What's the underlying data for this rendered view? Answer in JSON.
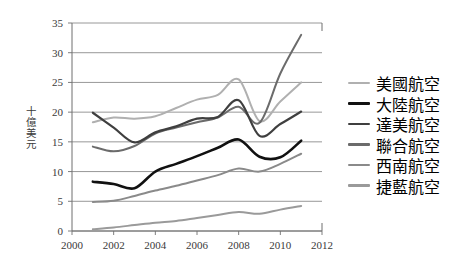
{
  "chart_data": {
    "type": "line",
    "title": "",
    "subtitle": "",
    "xlabel": "",
    "ylabel": "十億美元",
    "xlim": [
      2000,
      2012
    ],
    "ylim": [
      0,
      35
    ],
    "xticks": [
      2000,
      2002,
      2004,
      2006,
      2008,
      2010,
      2012
    ],
    "yticks": [
      0,
      5,
      10,
      15,
      20,
      25,
      30,
      35
    ],
    "grid": "horizontal",
    "legend_position": "right",
    "x": [
      2001,
      2002,
      2003,
      2004,
      2005,
      2006,
      2007,
      2008,
      2009,
      2010,
      2011
    ],
    "series": [
      {
        "name": "美國航空",
        "color": "#b0b0b0",
        "width": 2.0,
        "values": [
          18.3,
          19.1,
          18.9,
          19.3,
          20.7,
          22.1,
          22.9,
          25.5,
          18.5,
          21.8,
          25.0
        ]
      },
      {
        "name": "大陸航空",
        "color": "#111111",
        "width": 2.6,
        "values": [
          8.3,
          7.9,
          7.2,
          10.0,
          11.3,
          12.6,
          14.0,
          15.4,
          12.5,
          12.4,
          15.2
        ]
      },
      {
        "name": "達美航空",
        "color": "#3f3f3f",
        "width": 2.2,
        "values": [
          19.9,
          17.4,
          14.9,
          16.6,
          17.6,
          18.9,
          19.2,
          22.0,
          16.0,
          18.0,
          20.1
        ]
      },
      {
        "name": "聯合航空",
        "color": "#6b6b6b",
        "width": 2.0,
        "values": [
          14.2,
          13.4,
          14.3,
          16.4,
          17.4,
          18.3,
          19.1,
          20.9,
          18.2,
          26.5,
          33.0
        ]
      },
      {
        "name": "西南航空",
        "color": "#8a8a8a",
        "width": 2.0,
        "values": [
          4.9,
          5.1,
          5.9,
          6.8,
          7.6,
          8.5,
          9.4,
          10.5,
          10.0,
          11.3,
          13.0
        ]
      },
      {
        "name": "捷藍航空",
        "color": "#9a9a9a",
        "width": 2.0,
        "values": [
          0.3,
          0.6,
          1.0,
          1.4,
          1.7,
          2.2,
          2.7,
          3.2,
          2.9,
          3.6,
          4.2
        ]
      }
    ]
  },
  "axes": {
    "y_title": "十億美元",
    "y_tick_labels": [
      "35",
      "30",
      "25",
      "20",
      "15",
      "10",
      "5",
      "0"
    ],
    "x_tick_labels": [
      "2000",
      "2002",
      "2004",
      "2006",
      "2008",
      "2010",
      "2012"
    ]
  },
  "legend": {
    "items": [
      {
        "label": "美國航空",
        "color": "#b0b0b0",
        "thickness": "2.2px"
      },
      {
        "label": "大陸航空",
        "color": "#111111",
        "thickness": "3.2px"
      },
      {
        "label": "達美航空",
        "color": "#3f3f3f",
        "thickness": "2.8px"
      },
      {
        "label": "聯合航空",
        "color": "#6b6b6b",
        "thickness": "2.6px"
      },
      {
        "label": "西南航空",
        "color": "#8a8a8a",
        "thickness": "2.2px"
      },
      {
        "label": "捷藍航空",
        "color": "#9a9a9a",
        "thickness": "2.2px"
      }
    ]
  },
  "colors": {
    "axis": "#6f6f6f",
    "grid": "#7d7d7d",
    "background": "#ffffff",
    "text": "#3a3a3a"
  }
}
